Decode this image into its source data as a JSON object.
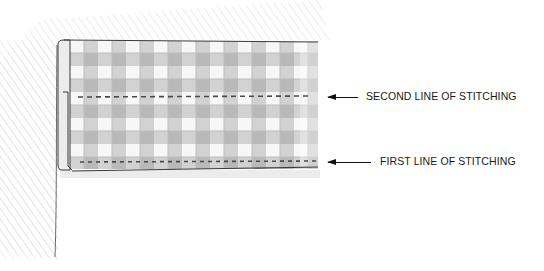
{
  "diagram": {
    "colors": {
      "check_gray": "#c8c8c8",
      "shade": "#e6e6e6",
      "outline": "#3a3a3a",
      "stitch": "#555555"
    },
    "callouts": [
      {
        "id": "second",
        "label": "SECOND LINE OF STITCHING"
      },
      {
        "id": "first",
        "label": "FIRST LINE OF STITCHING"
      }
    ]
  }
}
